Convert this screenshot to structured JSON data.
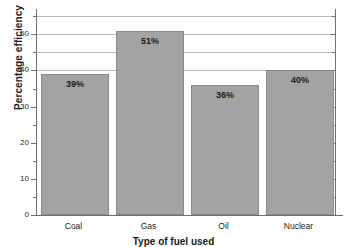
{
  "chart_data": {
    "type": "bar",
    "title": "",
    "categories": [
      "Coal",
      "Gas",
      "Oil",
      "Nuclear"
    ],
    "values": [
      39,
      51,
      36,
      40
    ],
    "data_labels": [
      "39%",
      "51%",
      "36%",
      "40%"
    ],
    "xlabel": "Type of fuel used",
    "ylabel": "Percentage efficiency",
    "ylim": [
      0,
      57
    ],
    "y_major_ticks": [
      0,
      10,
      20,
      30,
      40,
      50
    ],
    "y_major_tick_labels": [
      "0",
      "10",
      "20",
      "30",
      "40",
      "50"
    ],
    "y_minor_ticks": [
      5,
      15,
      25,
      35,
      45,
      55
    ],
    "gridlines": [
      40,
      45,
      50,
      55
    ],
    "grid": true,
    "legend": "none",
    "bar_color": "#a3a3a3",
    "bar_edge_color": "#8a8a8a",
    "grid_color": "#b9b9b9",
    "axis_color": "#6e6e6e",
    "label_text_color": "#1b1b1b"
  }
}
